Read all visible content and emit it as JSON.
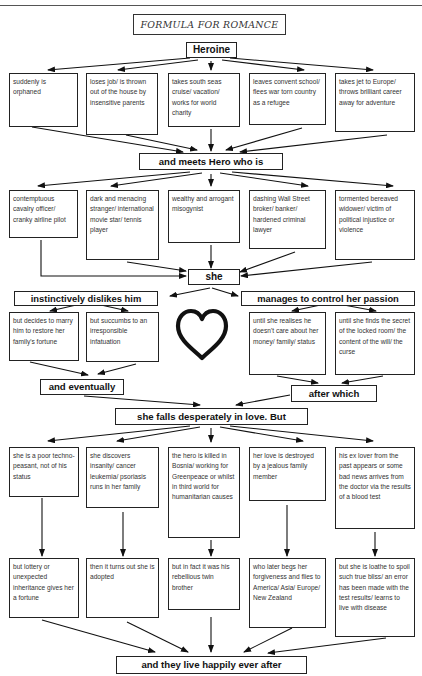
{
  "title": "FORMULA FOR ROMANCE",
  "heroine": "Heroine",
  "heroine_events": [
    "suddenly is orphaned",
    "loses job/ is thrown out of the house by insensitive parents",
    "takes south seas cruise/ vacation/ works for world charity",
    "leaves convent school/ flees war torn country as a refugee",
    "takes jet to Europe/ throws brilliant career away for adventure"
  ],
  "meets_hero": "and meets Hero who is",
  "hero_types": [
    "contemptuous cavalry officer/ cranky airline pilot",
    "dark and menacing stranger/ international movie star/ tennis player",
    "wealthy and arrogant misogynist",
    "dashing Wall Street broker/ banker/ hardened criminal lawyer",
    "tormented bereaved widower/ victim of political injustice or violence"
  ],
  "she": "she",
  "left_branch": {
    "label": "instinctively dislikes him",
    "options": [
      "but decides to marry him to restore her family's fortune",
      "but succumbs to an irresponsible infatuation"
    ],
    "join": "and eventually"
  },
  "right_branch": {
    "label": "manages to control her passion",
    "options": [
      "until she realises he doesn't care about her money/ family/ status",
      "until she finds the secret of the locked room/ the content of the will/ the curse"
    ],
    "join": "after which"
  },
  "heart_icon": "heart-outline",
  "falls_in_love": "she falls desperately in love. But",
  "obstacles": [
    "she is a poor techno-peasant, not of his status",
    "she discovers insanity/ cancer leukemia/ psoriasis runs in her family",
    "the hero is killed in Bosnia/ working for Greenpeace or whilst in third world for humanitarian causes",
    "her love is destroyed by a jealous family member",
    "his ex lover from the past appears or some bad news arrives from the doctor via the results of a blood test"
  ],
  "resolutions": [
    "but lottery or unexpected inheritance gives her a fortune",
    "then it turns out she is adopted",
    "but in fact it was his rebellious twin brother",
    "who later begs her forgiveness and flies to America/ Asia/ Europe/ New Zealand",
    "but she is loathe to spoil such true bliss/ an error has been made with the test results/ learns to live with disease"
  ],
  "ending": "and they live happily ever after"
}
